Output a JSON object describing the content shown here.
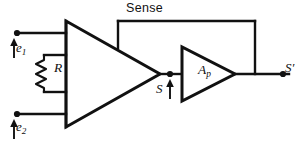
{
  "figure": {
    "type": "schematic-circuit-diagram",
    "background_color": "#ffffff",
    "line_color": "#111111"
  },
  "labels": {
    "sense": "Sense",
    "input_1": "e",
    "input_1_sub": "1",
    "input_2": "e",
    "input_2_sub": "2",
    "resistor": "R",
    "signal": "S",
    "amplifier": "A",
    "amplifier_sub": "p",
    "output": "S",
    "output_prime": "′"
  },
  "components": [
    {
      "name": "differential-amplifier",
      "shape": "triangle",
      "label": "",
      "inputs": 4,
      "orientation": "left-to-right"
    },
    {
      "name": "power-amplifier",
      "shape": "triangle",
      "label": "A",
      "label_sub": "p",
      "inputs": 1,
      "orientation": "left-to-right"
    },
    {
      "name": "gain-resistor",
      "shape": "zigzag",
      "label": "R"
    }
  ],
  "terminals": [
    {
      "name": "input-terminal-1",
      "label": "e",
      "sub": "1",
      "arrow": "up"
    },
    {
      "name": "input-terminal-2",
      "label": "e",
      "sub": "2",
      "arrow": "up"
    },
    {
      "name": "signal-node",
      "label": "S",
      "arrow": "up"
    },
    {
      "name": "output-terminal",
      "label": "S′",
      "arrow": "none"
    }
  ],
  "nets": [
    {
      "name": "sense-feedback",
      "label": "Sense",
      "from": "power-amplifier-output",
      "to": "differential-amplifier-top-input"
    },
    {
      "name": "signal-net",
      "label": "S",
      "from": "differential-amplifier-output",
      "to": "power-amplifier-input"
    }
  ]
}
